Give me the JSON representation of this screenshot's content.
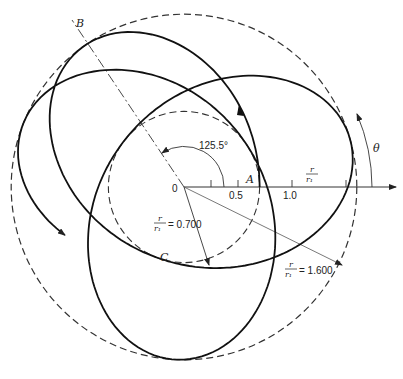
{
  "diagram": {
    "type": "orbit-rosette",
    "origin_px": [
      184,
      187
    ],
    "px_per_unit": 108,
    "orbit": {
      "r_min": 0.7,
      "r_max": 1.6,
      "apsidal_angle_deg": 125.5,
      "theta_start_deg": 0,
      "theta_end_deg": 923
    },
    "circles": [
      {
        "name": "inner-circle",
        "r": 0.7
      },
      {
        "name": "outer-circle",
        "r": 1.6
      }
    ],
    "axis": {
      "ticks": [
        0.25,
        0.5,
        1.0,
        1.5
      ],
      "tick_labels": [
        {
          "value": 0.5,
          "text": "0.5"
        },
        {
          "value": 1.0,
          "text": "1.0"
        }
      ],
      "label_num": "r",
      "label_den": "r₁"
    }
  },
  "labels": {
    "origin": "0",
    "point_a": "A",
    "point_b": "B",
    "point_c": "C",
    "theta": "θ",
    "angle": "125.5°",
    "r_num": "r",
    "r_den": "r₁",
    "inner_value": "= 0.700",
    "outer_value": "= 1.600"
  }
}
